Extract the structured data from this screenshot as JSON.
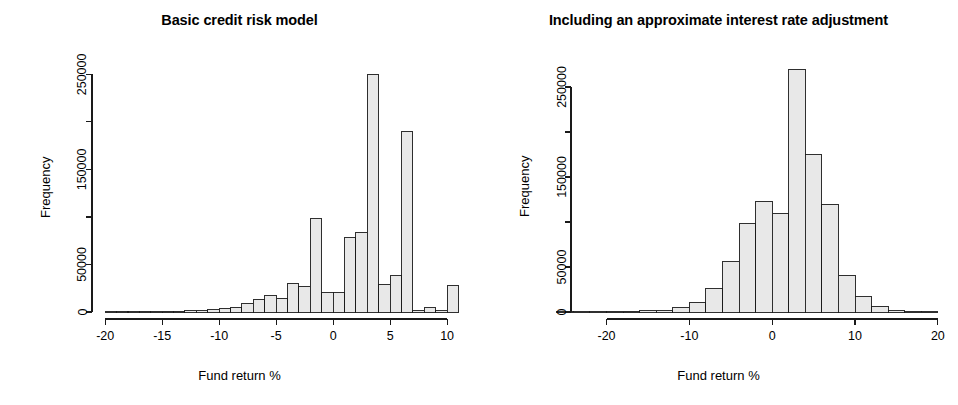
{
  "figure": {
    "width": 958,
    "height": 405,
    "background": "#ffffff",
    "bar_fill": "#e8e8e8",
    "bar_stroke": "#1a1a1a",
    "axis_color": "#1a1a1a"
  },
  "panels": [
    {
      "id": "basic-credit-risk-model",
      "title": "Basic credit risk model",
      "xlabel": "Fund return %",
      "ylabel": "Frequency"
    },
    {
      "id": "interest-rate-adjustment",
      "title": "Including an approximate interest rate adjustment",
      "xlabel": "Fund return %",
      "ylabel": "Frequency"
    }
  ],
  "chart_data": [
    {
      "type": "bar",
      "subtype": "histogram",
      "title": "Basic credit risk model",
      "xlabel": "Fund return %",
      "ylabel": "Frequency",
      "xlim": [
        -20.5,
        11.0
      ],
      "ylim": [
        0,
        262000
      ],
      "grid": false,
      "legend": null,
      "xticks": [
        -20,
        -15,
        -10,
        -5,
        0,
        5,
        10
      ],
      "xtick_labels": [
        "-20",
        "-15",
        "-10",
        "-5",
        "0",
        "5",
        "10"
      ],
      "yticks": [
        0,
        50000,
        100000,
        150000,
        200000,
        250000
      ],
      "ytick_labels": [
        "0",
        "50000",
        "",
        "150000",
        "",
        "250000"
      ],
      "bin_width": 1,
      "bin_edges": [
        -20,
        -19,
        -18,
        -17,
        -16,
        -15,
        -14,
        -13,
        -12,
        -11,
        -10,
        -9,
        -8,
        -7,
        -6,
        -5,
        -4,
        -3,
        -2,
        -1,
        0,
        1,
        2,
        3,
        4,
        5,
        6,
        7,
        8,
        9,
        10,
        11
      ],
      "bin_centers": [
        -19.5,
        -18.5,
        -17.5,
        -16.5,
        -15.5,
        -14.5,
        -13.5,
        -12.5,
        -11.5,
        -10.5,
        -9.5,
        -8.5,
        -7.5,
        -6.5,
        -5.5,
        -4.5,
        -3.5,
        -2.5,
        -1.5,
        -0.5,
        0.5,
        1.5,
        2.5,
        3.5,
        4.5,
        5.5,
        6.5,
        7.5,
        8.5,
        9.5,
        10.5
      ],
      "values": [
        120,
        180,
        260,
        360,
        520,
        700,
        950,
        1300,
        1800,
        2600,
        3800,
        5200,
        9000,
        13500,
        17000,
        14500,
        30000,
        27000,
        98000,
        20000,
        20000,
        78000,
        84000,
        250000,
        29000,
        38000,
        190000,
        1800,
        4500,
        1500,
        28000
      ]
    },
    {
      "type": "bar",
      "subtype": "histogram",
      "title": "Including an approximate interest rate adjustment",
      "xlabel": "Fund return %",
      "ylabel": "Frequency",
      "xlim": [
        -25.5,
        20.5
      ],
      "ylim": [
        0,
        280000
      ],
      "grid": false,
      "legend": null,
      "xticks": [
        -20,
        -10,
        0,
        10,
        20
      ],
      "xtick_labels": [
        "-20",
        "-10",
        "0",
        "10",
        "20"
      ],
      "yticks": [
        0,
        50000,
        100000,
        150000,
        200000,
        250000
      ],
      "ytick_labels": [
        "0",
        "50000",
        "",
        "150000",
        "",
        "250000"
      ],
      "bin_width": 2,
      "bin_edges": [
        -26,
        -24,
        -22,
        -20,
        -18,
        -16,
        -14,
        -12,
        -10,
        -8,
        -6,
        -4,
        -2,
        0,
        2,
        4,
        6,
        8,
        10,
        12,
        14,
        16,
        18,
        20
      ],
      "bin_centers": [
        -25,
        -23,
        -21,
        -19,
        -17,
        -15,
        -13,
        -11,
        -9,
        -7,
        -5,
        -3,
        -1,
        1,
        3,
        5,
        7,
        9,
        11,
        13,
        15,
        17,
        19
      ],
      "values": [
        60,
        100,
        200,
        400,
        700,
        1200,
        2200,
        4500,
        11000,
        26000,
        56000,
        98000,
        123000,
        110000,
        270000,
        175000,
        120000,
        41000,
        17000,
        6500,
        1200,
        300,
        80
      ]
    }
  ]
}
